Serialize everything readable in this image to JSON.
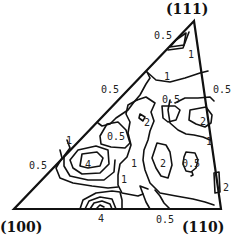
{
  "figure": {
    "type": "inverse-pole-figure",
    "colors": {
      "line": "#111111",
      "background": "#ffffff"
    },
    "poles": [
      {
        "label": "(111)",
        "x": 166,
        "y": 14
      },
      {
        "label": "(100)",
        "x": 0,
        "y": 232
      },
      {
        "label": "(110)",
        "x": 182,
        "y": 232
      }
    ],
    "triangle": {
      "points": "194,21 14,209 221,209"
    },
    "contour_labels": [
      {
        "text": "0.5",
        "x": 154,
        "y": 39
      },
      {
        "text": "1",
        "x": 188,
        "y": 58
      },
      {
        "text": "1",
        "x": 164,
        "y": 80
      },
      {
        "text": "0.5",
        "x": 101,
        "y": 93
      },
      {
        "text": "0.5",
        "x": 213,
        "y": 93
      },
      {
        "text": "0.5",
        "x": 162,
        "y": 103
      },
      {
        "text": "2",
        "x": 144,
        "y": 126
      },
      {
        "text": "2",
        "x": 200,
        "y": 125
      },
      {
        "text": "0.5",
        "x": 107,
        "y": 140
      },
      {
        "text": "1",
        "x": 66,
        "y": 144
      },
      {
        "text": "1",
        "x": 206,
        "y": 145
      },
      {
        "text": "0.5",
        "x": 29,
        "y": 169
      },
      {
        "text": "4",
        "x": 85,
        "y": 168
      },
      {
        "text": "1",
        "x": 131,
        "y": 167
      },
      {
        "text": "2",
        "x": 160,
        "y": 167
      },
      {
        "text": "0.5",
        "x": 182,
        "y": 167
      },
      {
        "text": "1",
        "x": 121,
        "y": 183
      },
      {
        "text": "2",
        "x": 223,
        "y": 191
      },
      {
        "text": "4",
        "x": 98,
        "y": 222
      },
      {
        "text": "0.5",
        "x": 156,
        "y": 223
      }
    ],
    "contours": [
      "M176,40 L186,33 L184,45 L170,47 Z",
      "M168,50 L183,48 L189,32",
      "M147,72 L156,80 L170,82 L185,78 L200,73 L208,71",
      "M147,72 L150,78 L146,84 L140,95 L134,102 L128,110 L116,118 L110,124 L102,126 L98,123",
      "M137,100 L146,97 L155,103 L151,112 L154,121 L150,131 L148,140 L144,150 L143,160 L145,170 L150,183 L160,193 L176,196 L193,199 L205,202 L214,205",
      "M137,100 L128,105 L126,114 L130,122 L128,133 L131,145 L127,157 L120,164 L118,175 L118,185 L122,193 L138,196 L143,194 L140,186 L148,189",
      "M162,106 L175,106 L180,110 L176,120 L168,122 L163,118 Z",
      "M140,114 L145,117 L143,121 L139,118 Z",
      "M190,110 L206,107 L212,115 L211,123 L205,127 L196,124 L189,120 Z",
      "M175,103 L185,98 L198,98 L210,97 L214,101",
      "M170,100 L168,110 L170,123 L178,130 L186,134 L194,135 L203,137 L210,140",
      "M107,124 L118,122 L126,130 L130,143 L125,148 L111,147 L101,144 L100,136 Z",
      "M157,143 L166,145 L170,152 L172,165 L168,178 L161,176 L156,168 L152,158 Z",
      "M186,152 L195,153 L198,160 L196,168 L191,172 L186,171 L183,164 L184,157 Z",
      "M192,172 L193,175 L191,176",
      "M82,154 L97,152 L103,158 L100,166 L88,168 L80,166 Z",
      "M78,150 L96,146 L108,150 L109,164 L100,173 L82,174 L73,168 L70,160 Z",
      "M67,140 L70,148 L64,156 L64,166 L70,176 L88,180 L104,180 L114,172 L115,160",
      "M60,150 L62,158 L56,168 L60,178 L73,183 L92,186 L108,188 L118,187",
      "M214,173 L219,172 L220,192 L215,193 Z",
      "M80,209 L83,200 L96,193 L112,191 L120,192 L122,200 L122,209",
      "M85,209 L89,201 L100,197 L112,199 L116,209",
      "M90,209 L94,203 L102,201 L110,204 L112,209",
      "M97,208 L100,205 L104,207",
      "M143,194 L146,202 L150,209",
      "M155,190 L160,196 L164,203 L170,209"
    ]
  }
}
